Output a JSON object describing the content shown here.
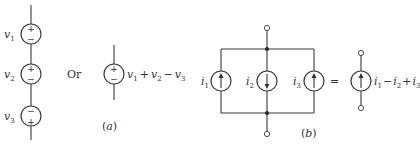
{
  "figure_a": {
    "caption": "(a)",
    "series_sources": [
      {
        "label": "v",
        "sub": "1",
        "top_sign": "+",
        "bottom_sign": "−"
      },
      {
        "label": "v",
        "sub": "2",
        "top_sign": "+",
        "bottom_sign": "−"
      },
      {
        "label": "v",
        "sub": "3",
        "top_sign": "−",
        "bottom_sign": "+"
      }
    ],
    "or_label": "Or",
    "equivalent": {
      "top_sign": "+",
      "bottom_sign": "−",
      "expression": "v1 + v2 − v3",
      "terms": [
        {
          "sym": "v",
          "sub": "1"
        },
        {
          "op": "+"
        },
        {
          "sym": "v",
          "sub": "2"
        },
        {
          "op": "−"
        },
        {
          "sym": "v",
          "sub": "3"
        }
      ]
    }
  },
  "figure_b": {
    "caption": "(b)",
    "parallel_sources": [
      {
        "label": "i",
        "sub": "1",
        "direction": "up"
      },
      {
        "label": "i",
        "sub": "2",
        "direction": "down"
      },
      {
        "label": "i",
        "sub": "3",
        "direction": "up"
      }
    ],
    "equals_label": "=",
    "equivalent": {
      "direction": "up",
      "expression": "i1 − i2 + i3",
      "terms": [
        {
          "sym": "i",
          "sub": "1"
        },
        {
          "op": "−"
        },
        {
          "sym": "i",
          "sub": "2"
        },
        {
          "op": "+"
        },
        {
          "sym": "i",
          "sub": "3"
        }
      ]
    }
  },
  "colors": {
    "wire": "#3a3a3a",
    "background": "#ffffff"
  }
}
